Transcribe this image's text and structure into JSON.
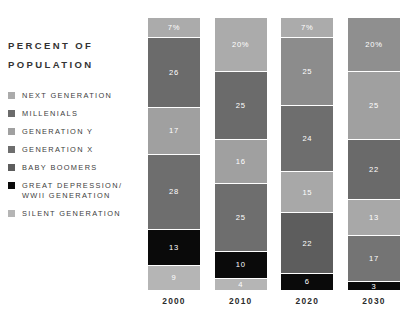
{
  "panel": {
    "title_line1": "PERCENT OF",
    "title_line2": "POPULATION"
  },
  "legend": {
    "items": [
      {
        "label": "NEXT GENERATION",
        "color": "#ababab",
        "key": "next-generation"
      },
      {
        "label": "MILLENIALS",
        "color": "#6b6b6b",
        "key": "millenials"
      },
      {
        "label": "GENERATION Y",
        "color": "#a0a0a0",
        "key": "generation-y"
      },
      {
        "label": "GENERATION X",
        "color": "#6e6e6e",
        "key": "generation-x"
      },
      {
        "label": "BABY BOOMERS",
        "color": "#5d5d5d",
        "key": "baby-boomers"
      },
      {
        "label": "GREAT DEPRESSION/\nWWII GENERATION",
        "color": "#0a0a0a",
        "key": "great-depression-wwii"
      },
      {
        "label": "SILENT GENERATION",
        "color": "#b5b5b5",
        "key": "silent-generation"
      }
    ]
  },
  "chart_data": {
    "type": "bar",
    "title": "PERCENT OF POPULATION",
    "xlabel": "",
    "ylabel": "PERCENT OF POPULATION",
    "stacked": true,
    "grid": false,
    "legend_position": "left",
    "ylim": [
      0,
      100
    ],
    "categories": [
      "2000",
      "2010",
      "2020",
      "2030"
    ],
    "series": [
      {
        "name": "NEXT GENERATION",
        "color": "#ababab",
        "values": [
          7,
          20,
          7,
          20
        ]
      },
      {
        "name": "MILLENIALS",
        "color": "#6b6b6b",
        "values": [
          26,
          25,
          25,
          25
        ]
      },
      {
        "name": "GENERATION Y",
        "color": "#a0a0a0",
        "values": [
          17,
          16,
          24,
          22
        ]
      },
      {
        "name": "GENERATION X",
        "color": "#6e6e6e",
        "values": [
          28,
          25,
          15,
          13
        ]
      },
      {
        "name": "BABY BOOMERS",
        "color": "#5d5d5d",
        "values": [
          13,
          10,
          22,
          17
        ]
      },
      {
        "name": "GREAT DEPRESSION/WWII GENERATION",
        "color": "#0a0a0a",
        "values": [
          9,
          4,
          6,
          3
        ]
      },
      {
        "name": "SILENT GENERATION",
        "color": "#b5b5b5",
        "values": [
          0,
          0,
          0,
          0
        ]
      }
    ],
    "columns": [
      {
        "year": "2000",
        "segments": [
          {
            "name": "NEXT GENERATION",
            "label": "7%",
            "value": 7,
            "color": "#ababab"
          },
          {
            "name": "MILLENIALS",
            "label": "26",
            "value": 26,
            "color": "#6b6b6b"
          },
          {
            "name": "GENERATION Y",
            "label": "17",
            "value": 17,
            "color": "#a0a0a0"
          },
          {
            "name": "GENERATION X",
            "label": "28",
            "value": 28,
            "color": "#6e6e6e"
          },
          {
            "name": "GREAT DEPRESSION/WWII GENERATION",
            "label": "13",
            "value": 13,
            "color": "#0a0a0a"
          },
          {
            "name": "SILENT GENERATION",
            "label": "9",
            "value": 9,
            "color": "#b5b5b5"
          }
        ]
      },
      {
        "year": "2010",
        "segments": [
          {
            "name": "NEXT GENERATION",
            "label": "20%",
            "value": 20,
            "color": "#ababab"
          },
          {
            "name": "MILLENIALS",
            "label": "25",
            "value": 25,
            "color": "#6b6b6b"
          },
          {
            "name": "GENERATION Y",
            "label": "16",
            "value": 16,
            "color": "#a0a0a0"
          },
          {
            "name": "GENERATION X",
            "label": "25",
            "value": 25,
            "color": "#6e6e6e"
          },
          {
            "name": "GREAT DEPRESSION/WWII GENERATION",
            "label": "10",
            "value": 10,
            "color": "#0a0a0a"
          },
          {
            "name": "SILENT GENERATION",
            "label": "4",
            "value": 4,
            "color": "#b5b5b5"
          }
        ]
      },
      {
        "year": "2020",
        "segments": [
          {
            "name": "NEXT GENERATION",
            "label": "7%",
            "value": 7,
            "color": "#ababab"
          },
          {
            "name": "MILLENIALS",
            "label": "25",
            "value": 25,
            "color": "#8c8c8c"
          },
          {
            "name": "GENERATION Y",
            "label": "24",
            "value": 24,
            "color": "#6e6e6e"
          },
          {
            "name": "GENERATION X",
            "label": "15",
            "value": 15,
            "color": "#a8a8a8"
          },
          {
            "name": "BABY BOOMERS",
            "label": "22",
            "value": 22,
            "color": "#5d5d5d"
          },
          {
            "name": "GREAT DEPRESSION/WWII GENERATION",
            "label": "6",
            "value": 6,
            "color": "#0a0a0a"
          }
        ]
      },
      {
        "year": "2030",
        "segments": [
          {
            "name": "NEXT GENERATION",
            "label": "20%",
            "value": 20,
            "color": "#8f8f8f"
          },
          {
            "name": "MILLENIALS",
            "label": "25",
            "value": 25,
            "color": "#a0a0a0"
          },
          {
            "name": "GENERATION Y",
            "label": "22",
            "value": 22,
            "color": "#6a6a6a"
          },
          {
            "name": "GENERATION X",
            "label": "13",
            "value": 13,
            "color": "#a8a8a8"
          },
          {
            "name": "BABY BOOMERS",
            "label": "17",
            "value": 17,
            "color": "#747474"
          },
          {
            "name": "GREAT DEPRESSION/WWII GENERATION",
            "label": "3",
            "value": 3,
            "color": "#0a0a0a"
          }
        ]
      }
    ]
  }
}
